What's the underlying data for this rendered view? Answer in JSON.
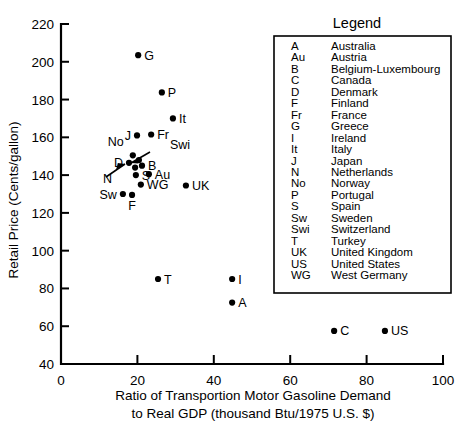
{
  "chart_data": {
    "type": "scatter",
    "title": "",
    "xlabel": "Ratio of Transportion Motor Gasoline Demand to Real GDP (thousand Btu/1975 U.S. $)",
    "xlabel_line1": "Ratio of Transportion Motor Gasoline Demand",
    "xlabel_line2": "to Real GDP (thousand Btu/1975 U.S. $)",
    "ylabel": "Retail Price (Cents/gallon)",
    "xlim": [
      0,
      100
    ],
    "ylim": [
      40,
      220
    ],
    "xticks": [
      0,
      20,
      40,
      60,
      80,
      100
    ],
    "yticks": [
      40,
      60,
      80,
      100,
      120,
      140,
      160,
      180,
      200,
      220
    ],
    "grid": false,
    "legend_position": "inside-top-right",
    "marker_color": "#000000",
    "points": [
      {
        "code": "G",
        "country": "Greece",
        "x": 20.2,
        "y": 203.5,
        "label_pos": "right"
      },
      {
        "code": "P",
        "country": "Portugal",
        "x": 26.4,
        "y": 183.8,
        "label_pos": "right"
      },
      {
        "code": "It",
        "country": "Italy",
        "x": 29.3,
        "y": 170.0,
        "label_pos": "right"
      },
      {
        "code": "Fr",
        "country": "France",
        "x": 23.6,
        "y": 161.5,
        "label_pos": "right"
      },
      {
        "code": "J",
        "country": "Japan",
        "x": 19.9,
        "y": 161.0,
        "label_pos": "left"
      },
      {
        "code": "No",
        "country": "Norway",
        "x": 18.8,
        "y": 150.5,
        "label_pos": "callout-up-left"
      },
      {
        "code": "Swi",
        "country": "Switzerland",
        "x": 20.4,
        "y": 148.0,
        "label_pos": "callout-up-right"
      },
      {
        "code": "D",
        "country": "Denmark",
        "x": 17.8,
        "y": 146.5,
        "label_pos": "left"
      },
      {
        "code": "B",
        "country": "Belgium-Luxembourg",
        "x": 21.2,
        "y": 145.0,
        "label_pos": "right"
      },
      {
        "code": "N",
        "country": "Netherlands",
        "x": 19.4,
        "y": 144.0,
        "label_pos": "callout-down-left"
      },
      {
        "code": "S",
        "country": "Spain",
        "x": 19.6,
        "y": 140.0,
        "label_pos": "right"
      },
      {
        "code": "Au",
        "country": "Austria",
        "x": 23.0,
        "y": 140.5,
        "label_pos": "right"
      },
      {
        "code": "WG",
        "country": "West Germany",
        "x": 20.9,
        "y": 135.0,
        "label_pos": "right"
      },
      {
        "code": "UK",
        "country": "United Kingdom",
        "x": 32.7,
        "y": 134.5,
        "label_pos": "right"
      },
      {
        "code": "F",
        "country": "Finland",
        "x": 18.6,
        "y": 129.5,
        "label_pos": "below"
      },
      {
        "code": "Sw",
        "country": "Sweden",
        "x": 16.2,
        "y": 130.0,
        "label_pos": "left"
      },
      {
        "code": "T",
        "country": "Turkey",
        "x": 25.4,
        "y": 85.0,
        "label_pos": "right"
      },
      {
        "code": "I",
        "country": "Ireland",
        "x": 44.8,
        "y": 85.0,
        "label_pos": "right"
      },
      {
        "code": "A",
        "country": "Australia",
        "x": 44.8,
        "y": 72.5,
        "label_pos": "right"
      },
      {
        "code": "C",
        "country": "Canada",
        "x": 71.5,
        "y": 57.5,
        "label_pos": "right"
      },
      {
        "code": "US",
        "country": "United States",
        "x": 84.8,
        "y": 57.5,
        "label_pos": "right"
      }
    ]
  },
  "legend": {
    "title": "Legend",
    "entries": [
      {
        "code": "A",
        "name": "Australia"
      },
      {
        "code": "Au",
        "name": "Austria"
      },
      {
        "code": "B",
        "name": "Belgium-Luxembourg"
      },
      {
        "code": "C",
        "name": "Canada"
      },
      {
        "code": "D",
        "name": "Denmark"
      },
      {
        "code": "F",
        "name": "Finland"
      },
      {
        "code": "Fr",
        "name": "France"
      },
      {
        "code": "G",
        "name": "Greece"
      },
      {
        "code": "I",
        "name": "Ireland"
      },
      {
        "code": "It",
        "name": "Italy"
      },
      {
        "code": "J",
        "name": "Japan"
      },
      {
        "code": "N",
        "name": "Netherlands"
      },
      {
        "code": "No",
        "name": "Norway"
      },
      {
        "code": "P",
        "name": "Portugal"
      },
      {
        "code": "S",
        "name": "Spain"
      },
      {
        "code": "Sw",
        "name": "Sweden"
      },
      {
        "code": "Swi",
        "name": "Switzerland"
      },
      {
        "code": "T",
        "name": "Turkey"
      },
      {
        "code": "UK",
        "name": "United Kingdom"
      },
      {
        "code": "US",
        "name": "United States"
      },
      {
        "code": "WG",
        "name": "West Germany"
      }
    ]
  }
}
